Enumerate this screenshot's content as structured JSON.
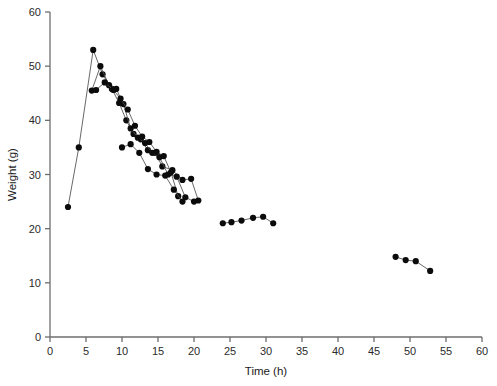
{
  "chart_data": {
    "type": "line",
    "title": "",
    "xlabel": "Time (h)",
    "ylabel": "Weight (g)",
    "xlim": [
      0,
      60
    ],
    "ylim": [
      0,
      60
    ],
    "xticks": [
      0,
      5,
      10,
      15,
      20,
      25,
      30,
      35,
      40,
      45,
      50,
      55,
      60
    ],
    "yticks": [
      0,
      10,
      20,
      30,
      40,
      50,
      60
    ],
    "xtick_labels": [
      "0",
      "5",
      "10",
      "15",
      "20",
      "25",
      "30",
      "35",
      "40",
      "45",
      "50",
      "55",
      "60"
    ],
    "ytick_labels": [
      "0",
      "10",
      "20",
      "30",
      "40",
      "50",
      "60"
    ],
    "grid": false,
    "legend": "none",
    "marker": "filled-circle",
    "marker_color": "#0b0b0b",
    "line_color": "#4d4d4d",
    "series": [
      {
        "name": "series-1",
        "x": [
          2.5,
          4.0,
          6.0,
          7.3,
          8.6,
          9.6,
          10.6,
          11.6,
          12.6,
          13.6,
          14.6,
          15.6,
          17.0,
          18.4,
          19.6,
          20.6
        ],
        "y": [
          24.0,
          35.0,
          53.0,
          48.5,
          45.8,
          43.2,
          40.0,
          37.5,
          36.5,
          34.5,
          34.0,
          31.5,
          30.8,
          29.0,
          29.2,
          25.2
        ]
      },
      {
        "name": "series-2",
        "x": [
          5.8,
          7.0,
          8.2,
          9.2,
          10.2,
          11.2,
          12.2,
          13.2,
          14.2,
          15.2,
          16.4,
          17.6,
          18.8,
          20.0
        ],
        "y": [
          45.5,
          50.0,
          46.5,
          45.8,
          43.0,
          38.5,
          36.8,
          35.8,
          34.0,
          33.2,
          30.0,
          29.6,
          25.8,
          25.0
        ]
      },
      {
        "name": "series-3",
        "x": [
          6.4,
          7.6,
          8.8,
          9.8,
          10.8,
          11.8,
          12.8,
          13.8,
          14.8,
          15.8,
          16.8,
          17.8
        ],
        "y": [
          45.6,
          47.0,
          45.6,
          44.0,
          42.0,
          39.0,
          37.0,
          36.0,
          34.2,
          33.4,
          30.4,
          26.0
        ]
      },
      {
        "name": "series-4",
        "x": [
          10.0,
          11.2,
          12.4,
          13.6,
          14.8,
          16.0,
          17.2,
          18.4
        ],
        "y": [
          35.0,
          35.6,
          34.0,
          31.0,
          30.0,
          29.8,
          27.2,
          25.0
        ]
      },
      {
        "name": "series-5",
        "x": [
          24.0,
          25.2,
          26.6,
          28.2,
          29.6,
          31.0
        ],
        "y": [
          21.0,
          21.2,
          21.5,
          22.0,
          22.2,
          21.0
        ]
      },
      {
        "name": "series-6",
        "x": [
          48.0,
          49.4,
          50.8,
          52.8
        ],
        "y": [
          14.8,
          14.2,
          14.0,
          12.2
        ]
      }
    ]
  }
}
